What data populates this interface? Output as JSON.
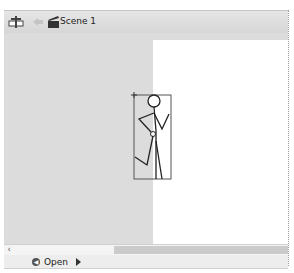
{
  "toolbar": {
    "edit_scene_icon": "edit-scene-icon",
    "back_icon": "back-arrow-icon",
    "scene_icon": "clapperboard-icon",
    "scene_label": "Scene 1"
  },
  "stage": {
    "background_color": "#ffffff",
    "pasteboard_color": "#dcdcdc",
    "selected_symbol": "stick-figure"
  },
  "scrollbar": {
    "left_arrow": "‹"
  },
  "statusbar": {
    "prev_icon": "circle-back-icon",
    "label": "Open",
    "next_icon": "play-icon"
  }
}
